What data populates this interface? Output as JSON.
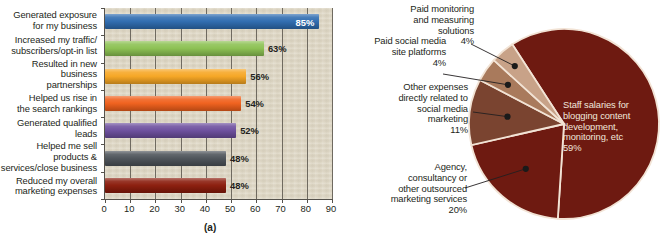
{
  "figure": {
    "panel_a_caption": "(a)",
    "panel_b_caption": "(b)"
  },
  "colors": {
    "plot_background": "#ded7c5",
    "axis": "#55524c",
    "gridline": "#6f6a60",
    "bar_blue": "#2f6cb0",
    "bar_green": "#8cc152",
    "bar_orange": "#f6a623",
    "bar_orange_red": "#f0601c",
    "bar_purple": "#6d4f9e",
    "bar_gray": "#4d5359",
    "bar_dark_red": "#8b1c0c",
    "pie_dark_red": "#6e1a11",
    "pie_brown": "#7a4430",
    "pie_tan": "#a97a5c",
    "pie_light_tan": "#c8a288",
    "pie_divider": "#f2e3d5"
  },
  "chart_data": [
    {
      "type": "bar",
      "orientation": "horizontal",
      "title": "",
      "xlabel": "",
      "ylabel": "",
      "xlim": [
        0,
        90
      ],
      "xticks": [
        0,
        10,
        20,
        30,
        40,
        50,
        60,
        70,
        80,
        90
      ],
      "grid": true,
      "legend": "none",
      "categories": [
        "Generated exposure for my business",
        "Increased my traffic/subscribers/opt-in list",
        "Resulted in new business partnerships",
        "Helped us rise in the search rankings",
        "Generated qualified leads",
        "Helped me sell products & services/close business",
        "Reduced my overall marketing expenses"
      ],
      "category_lines": [
        [
          "Generated exposure",
          "for my business"
        ],
        [
          "Increased my traffic/",
          "subscribers/opt-in list"
        ],
        [
          "Resulted in new business",
          "partnerships"
        ],
        [
          "Helped us rise in",
          "the search rankings"
        ],
        [
          "Generated qualified",
          "leads"
        ],
        [
          "Helped me sell products &",
          "services/close business"
        ],
        [
          "Reduced my overall",
          "marketing expenses"
        ]
      ],
      "values": [
        85,
        63,
        56,
        54,
        52,
        48,
        48
      ],
      "value_labels": [
        "85%",
        "63%",
        "56%",
        "54%",
        "52%",
        "48%",
        "48%"
      ],
      "label_position": [
        "inside",
        "outside",
        "outside",
        "outside",
        "outside",
        "outside",
        "outside"
      ],
      "bar_colors": [
        "#2f6cb0",
        "#8cc152",
        "#f6a623",
        "#f0601c",
        "#6d4f9e",
        "#4d5359",
        "#8b1c0c"
      ]
    },
    {
      "type": "pie",
      "title": "",
      "labels": [
        "Staff salaries for blogging content development, monitoring, etc",
        "Agency, consultancy or other outsourced marketing services",
        "Other expenses directly related to social media marketing",
        "Paid social media site platforms",
        "Paid monitoring and measuring solutions"
      ],
      "label_lines": [
        [
          "Staff salaries for",
          "blogging content",
          "development,",
          "monitoring, etc",
          "59%"
        ],
        [
          "Agency,",
          "consultancy or",
          "other outsourced",
          "marketing services",
          "20%"
        ],
        [
          "Other expenses",
          "directly related to",
          "social media",
          "marketing",
          "11%"
        ],
        [
          "Paid social media",
          "site platforms",
          "4%"
        ],
        [
          "Paid monitoring",
          "and measuring",
          "solutions",
          "4%"
        ]
      ],
      "values": [
        59,
        20,
        11,
        4,
        4
      ],
      "value_labels": [
        "59%",
        "20%",
        "11%",
        "4%",
        "4%"
      ],
      "slice_colors": [
        "#6e1a11",
        "#6e1a11",
        "#7a4430",
        "#a97a5c",
        "#c8a288"
      ],
      "legend": "callout-labels"
    }
  ]
}
